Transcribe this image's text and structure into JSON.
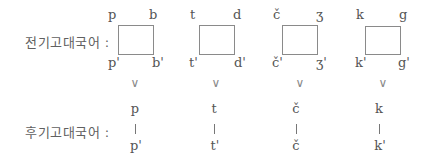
{
  "early_stage": {
    "label": "전기고대국어 :",
    "groups": [
      {
        "tl": "p",
        "tr": "b",
        "bl": "p'",
        "br": "b'"
      },
      {
        "tl": "t",
        "tr": "d",
        "bl": "t'",
        "br": "d'"
      },
      {
        "tl": "č",
        "tr": "ʒ",
        "bl": "č'",
        "br": "ʒ'"
      },
      {
        "tl": "k",
        "tr": "g",
        "bl": "k'",
        "br": "g'"
      }
    ]
  },
  "transition_symbol": "∨",
  "late_stage": {
    "label": "후기고대국어 :",
    "groups": [
      {
        "top": "p",
        "connector": "|",
        "bottom": "p'"
      },
      {
        "top": "t",
        "connector": "|",
        "bottom": "t'"
      },
      {
        "top": "č",
        "connector": "|",
        "bottom": "č"
      },
      {
        "top": "k",
        "connector": "|",
        "bottom": "k'"
      }
    ]
  }
}
